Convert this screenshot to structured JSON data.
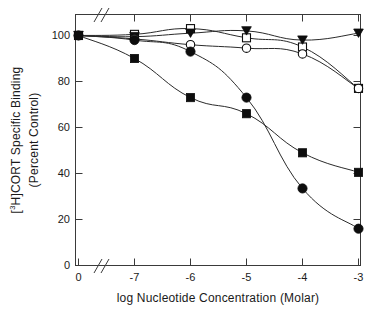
{
  "chart_data": {
    "type": "line",
    "title": "",
    "xlabel": "log Nucleotide Concentration (Molar)",
    "ylabel": "[3H]CORT Specific Binding (Percent Control)",
    "ylabel_line1_prefix": "[",
    "ylabel_line1_sup": "3",
    "ylabel_line1_rest": "H]CORT Specific Binding",
    "ylabel_line2": "(Percent Control)",
    "x": [
      0,
      -7,
      -6,
      -5,
      -4,
      -3
    ],
    "xtick_labels": [
      "0",
      "-7",
      "-6",
      "-5",
      "-4",
      "-3"
    ],
    "ytick_labels": [
      "0",
      "20",
      "40",
      "60",
      "80",
      "100"
    ],
    "ytick_values": [
      0,
      20,
      40,
      60,
      80,
      100
    ],
    "xlim": [
      0,
      -3
    ],
    "ylim": [
      0,
      107
    ],
    "grid": false,
    "legend": "none",
    "axis_break_x": true,
    "axis_break_note": "double-slash break on x axis between 0 and -7",
    "series": [
      {
        "name": "open-square",
        "marker": "open-square",
        "values": [
          100,
          100.5,
          103,
          99,
          95,
          77
        ]
      },
      {
        "name": "filled-triangle-down",
        "marker": "filled-triangle-down",
        "values": [
          100,
          99.5,
          101,
          102,
          98,
          101
        ]
      },
      {
        "name": "open-circle",
        "marker": "open-circle",
        "values": [
          100,
          98.5,
          96,
          94.5,
          92,
          77
        ]
      },
      {
        "name": "filled-circle",
        "marker": "filled-circle",
        "values": [
          100,
          98,
          93,
          73,
          33.5,
          16
        ]
      },
      {
        "name": "filled-square",
        "marker": "filled-square",
        "values": [
          100,
          90,
          73,
          66,
          49,
          40.5
        ]
      }
    ]
  }
}
